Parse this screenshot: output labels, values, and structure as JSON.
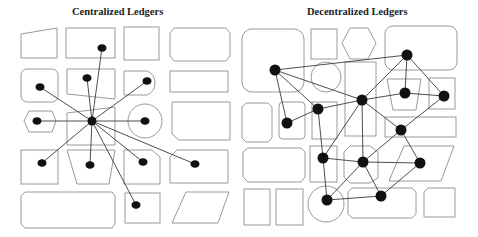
{
  "panels": {
    "left": {
      "title": "Centralized Ledgers",
      "topology": "star",
      "hub": {
        "x": 92,
        "y": 121,
        "r": 5
      },
      "nodes": [
        {
          "x": 102,
          "y": 48
        },
        {
          "x": 87,
          "y": 78
        },
        {
          "x": 40,
          "y": 87
        },
        {
          "x": 147,
          "y": 81
        },
        {
          "x": 37,
          "y": 121
        },
        {
          "x": 145,
          "y": 121
        },
        {
          "x": 42,
          "y": 163
        },
        {
          "x": 90,
          "y": 165
        },
        {
          "x": 143,
          "y": 162
        },
        {
          "x": 195,
          "y": 164
        },
        {
          "x": 136,
          "y": 205
        }
      ]
    },
    "right": {
      "title": "Decentralized Ledgers",
      "topology": "mesh",
      "nodes": [
        {
          "id": "A",
          "x": 275,
          "y": 70
        },
        {
          "id": "B",
          "x": 407,
          "y": 55
        },
        {
          "id": "C",
          "x": 362,
          "y": 100
        },
        {
          "id": "D",
          "x": 318,
          "y": 109
        },
        {
          "id": "E",
          "x": 405,
          "y": 93
        },
        {
          "id": "F",
          "x": 444,
          "y": 96
        },
        {
          "id": "G",
          "x": 287,
          "y": 123
        },
        {
          "id": "H",
          "x": 401,
          "y": 130
        },
        {
          "id": "I",
          "x": 323,
          "y": 158
        },
        {
          "id": "J",
          "x": 363,
          "y": 162
        },
        {
          "id": "K",
          "x": 420,
          "y": 163
        },
        {
          "id": "L",
          "x": 327,
          "y": 200
        },
        {
          "id": "M",
          "x": 381,
          "y": 196
        }
      ],
      "edges": [
        [
          "A",
          "B"
        ],
        [
          "A",
          "C"
        ],
        [
          "A",
          "D"
        ],
        [
          "A",
          "G"
        ],
        [
          "G",
          "D"
        ],
        [
          "D",
          "C"
        ],
        [
          "C",
          "E"
        ],
        [
          "C",
          "B"
        ],
        [
          "B",
          "E"
        ],
        [
          "B",
          "F"
        ],
        [
          "E",
          "F"
        ],
        [
          "C",
          "H"
        ],
        [
          "F",
          "H"
        ],
        [
          "D",
          "I"
        ],
        [
          "C",
          "I"
        ],
        [
          "C",
          "J"
        ],
        [
          "H",
          "J"
        ],
        [
          "H",
          "K"
        ],
        [
          "I",
          "J"
        ],
        [
          "J",
          "K"
        ],
        [
          "I",
          "L"
        ],
        [
          "J",
          "M"
        ],
        [
          "L",
          "H"
        ],
        [
          "L",
          "M"
        ],
        [
          "K",
          "M"
        ]
      ]
    }
  }
}
